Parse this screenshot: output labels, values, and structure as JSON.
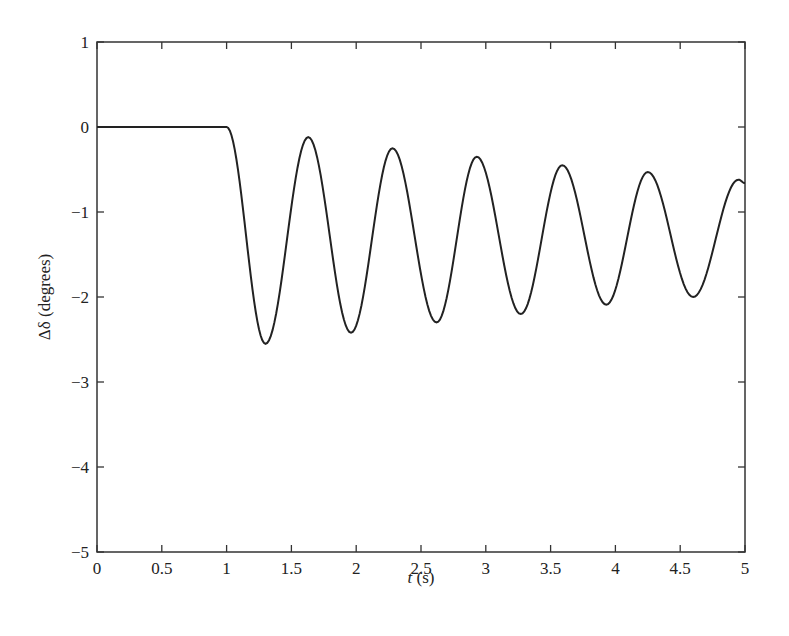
{
  "chart_data": {
    "type": "line",
    "title": "",
    "xlabel": "t (s)",
    "xlabel_var": "t",
    "xlabel_unit": " (s)",
    "ylabel": "Δδ (degrees)",
    "xlim": [
      0,
      5
    ],
    "ylim": [
      -5,
      1
    ],
    "grid": false,
    "legend": null,
    "x_ticks": [
      0,
      0.5,
      1,
      1.5,
      2,
      2.5,
      3,
      3.5,
      4,
      4.5,
      5
    ],
    "x_tick_labels": [
      "0",
      "0.5",
      "1",
      "1.5",
      "2",
      "2.5",
      "3",
      "3.5",
      "4",
      "4.5",
      "5"
    ],
    "y_ticks": [
      1,
      0,
      -1,
      -2,
      -3,
      -4,
      -5
    ],
    "y_tick_labels": [
      "1",
      "0",
      "−1",
      "−2",
      "−3",
      "−4",
      "−5"
    ],
    "series": [
      {
        "name": "Δδ",
        "color": "#222222",
        "description": "Flat at 0 until t = 1 s, then damped oscillation about ~ -1.3 deg",
        "x": [
          0,
          1.0,
          1.3,
          1.63,
          1.96,
          2.28,
          2.62,
          2.93,
          3.27,
          3.59,
          3.93,
          4.25,
          4.6,
          4.95,
          5.0
        ],
        "y": [
          0,
          0,
          -2.55,
          -0.12,
          -2.42,
          -0.25,
          -2.3,
          -0.35,
          -2.2,
          -0.45,
          -2.09,
          -0.53,
          -2.0,
          -0.62,
          -0.66
        ]
      }
    ]
  }
}
